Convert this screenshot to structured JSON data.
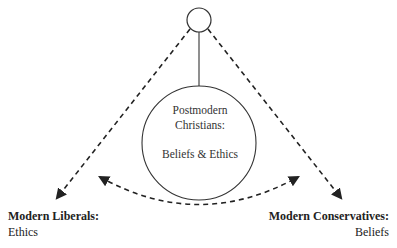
{
  "diagram": {
    "top_node": {
      "shape": "circle",
      "label": ""
    },
    "center_node": {
      "title_line1": "Postmodern",
      "title_line2": "Christians:",
      "subtitle": "Beliefs & Ethics"
    },
    "left_node": {
      "title": "Modern Liberals:",
      "subtitle": "Ethics"
    },
    "right_node": {
      "title": "Modern Conservatives:",
      "subtitle": "Beliefs"
    },
    "edges": [
      {
        "from": "top_node",
        "to": "center_node",
        "style": "solid"
      },
      {
        "from": "top_node",
        "to": "left_node",
        "style": "dashed",
        "arrow": "end"
      },
      {
        "from": "top_node",
        "to": "right_node",
        "style": "dashed",
        "arrow": "end"
      },
      {
        "from": "left_node",
        "to": "right_node",
        "style": "dashed-curve",
        "arrow": "both"
      }
    ],
    "colors": {
      "stroke": "#333333",
      "text": "#222222",
      "background": "#ffffff"
    }
  }
}
